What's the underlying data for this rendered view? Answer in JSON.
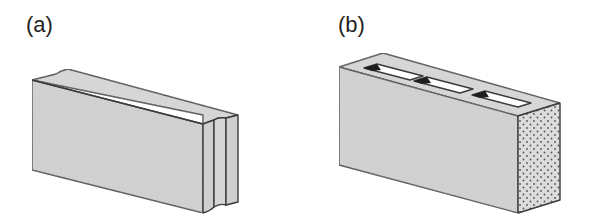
{
  "figure": {
    "panels": [
      {
        "id": "a",
        "label": "(a)",
        "description": "Solid concrete block with tongue-and-groove ends"
      },
      {
        "id": "b",
        "label": "(b)",
        "description": "Hollow concrete block with three cores"
      }
    ],
    "colors": {
      "face": "#d3d3d3",
      "top": "#dcdcdc",
      "outline": "#3a3a3a",
      "core_shadow": "#1e1e1e",
      "dots": "#555555"
    }
  }
}
